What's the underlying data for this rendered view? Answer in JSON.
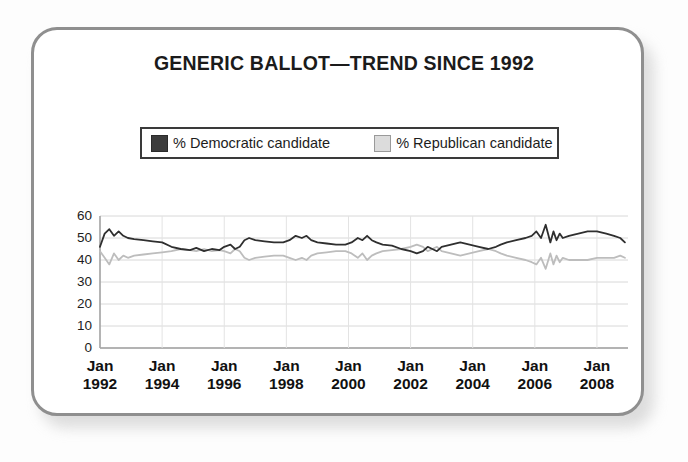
{
  "frame": {
    "border_color": "#8f8f8f",
    "background": "#ffffff"
  },
  "chart_data": {
    "type": "line",
    "title": "GENERIC BALLOT—TREND SINCE 1992",
    "xlabel": "",
    "ylabel": "",
    "ylim": [
      0,
      60
    ],
    "yticks": [
      60,
      50,
      40,
      30,
      20,
      10,
      0
    ],
    "grid": true,
    "legend_position": "top",
    "xticklabels": [
      {
        "month": "Jan",
        "year": "1992"
      },
      {
        "month": "Jan",
        "year": "1994"
      },
      {
        "month": "Jan",
        "year": "1996"
      },
      {
        "month": "Jan",
        "year": "1998"
      },
      {
        "month": "Jan",
        "year": "2000"
      },
      {
        "month": "Jan",
        "year": "2002"
      },
      {
        "month": "Jan",
        "year": "2004"
      },
      {
        "month": "Jan",
        "year": "2006"
      },
      {
        "month": "Jan",
        "year": "2008"
      }
    ],
    "xlim": [
      1992.0,
      2009.0
    ],
    "series": [
      {
        "name": "% Democratic candidate",
        "color": "#2f2f2f",
        "x": [
          1992.0,
          1992.15,
          1992.3,
          1992.45,
          1992.6,
          1992.75,
          1992.9,
          1993.1,
          1993.4,
          1993.7,
          1994.0,
          1994.3,
          1994.6,
          1994.9,
          1995.1,
          1995.35,
          1995.6,
          1995.85,
          1996.0,
          1996.2,
          1996.35,
          1996.5,
          1996.65,
          1996.8,
          1997.0,
          1997.3,
          1997.6,
          1997.9,
          1998.1,
          1998.3,
          1998.5,
          1998.65,
          1998.8,
          1999.0,
          1999.3,
          1999.6,
          1999.9,
          2000.1,
          2000.3,
          2000.45,
          2000.6,
          2000.75,
          2000.9,
          2001.1,
          2001.4,
          2001.7,
          2002.0,
          2002.2,
          2002.4,
          2002.55,
          2002.7,
          2002.85,
          2003.0,
          2003.3,
          2003.6,
          2003.9,
          2004.2,
          2004.5,
          2004.75,
          2004.9,
          2005.1,
          2005.4,
          2005.7,
          2005.9,
          2006.05,
          2006.2,
          2006.35,
          2006.5,
          2006.6,
          2006.7,
          2006.8,
          2006.9,
          2007.1,
          2007.4,
          2007.7,
          2008.0,
          2008.3,
          2008.55,
          2008.75,
          2008.9
        ],
        "y": [
          46,
          52,
          54,
          51,
          53,
          51,
          50,
          49.5,
          49,
          48.5,
          48,
          46,
          45,
          44.5,
          45.5,
          44,
          45,
          44.5,
          46,
          47,
          45,
          46,
          49,
          50,
          49,
          48.5,
          48,
          48,
          49,
          51,
          50,
          51,
          49,
          48,
          47.5,
          47,
          47,
          48,
          50,
          49,
          51,
          49,
          48,
          47,
          46.5,
          45,
          44,
          43,
          44,
          46,
          45,
          44,
          46,
          47,
          48,
          47,
          46,
          45,
          46,
          47,
          48,
          49,
          50,
          51,
          53,
          50,
          56,
          48,
          53,
          49,
          52,
          50,
          51,
          52,
          53,
          53,
          52,
          51,
          50,
          48
        ],
        "note": "Dark line, hovers 44–54, rises after 2005"
      },
      {
        "name": "% Republican candidate",
        "color": "#bdbdbd",
        "x": [
          1992.0,
          1992.15,
          1992.3,
          1992.45,
          1992.6,
          1992.75,
          1992.9,
          1993.1,
          1993.4,
          1993.7,
          1994.0,
          1994.3,
          1994.6,
          1994.9,
          1995.1,
          1995.35,
          1995.6,
          1995.85,
          1996.0,
          1996.2,
          1996.35,
          1996.5,
          1996.65,
          1996.8,
          1997.0,
          1997.3,
          1997.6,
          1997.9,
          1998.1,
          1998.3,
          1998.5,
          1998.65,
          1998.8,
          1999.0,
          1999.3,
          1999.6,
          1999.9,
          2000.1,
          2000.3,
          2000.45,
          2000.6,
          2000.75,
          2000.9,
          2001.1,
          2001.4,
          2001.7,
          2002.0,
          2002.2,
          2002.4,
          2002.55,
          2002.7,
          2002.85,
          2003.0,
          2003.3,
          2003.6,
          2003.9,
          2004.2,
          2004.5,
          2004.75,
          2004.9,
          2005.1,
          2005.4,
          2005.7,
          2005.9,
          2006.05,
          2006.2,
          2006.35,
          2006.5,
          2006.6,
          2006.7,
          2006.8,
          2006.9,
          2007.1,
          2007.4,
          2007.7,
          2008.0,
          2008.3,
          2008.55,
          2008.75,
          2008.9
        ],
        "y": [
          44,
          41,
          38,
          43,
          40,
          42,
          41,
          42,
          42.5,
          43,
          43.5,
          44,
          45,
          44.5,
          44,
          45,
          44,
          44.5,
          44,
          43,
          45,
          44,
          41,
          40,
          41,
          41.5,
          42,
          42,
          41,
          40,
          41,
          40,
          42,
          43,
          43.5,
          44,
          44,
          43,
          41,
          43,
          40,
          42,
          43,
          44,
          44.5,
          45,
          46,
          47,
          46,
          44,
          45,
          46,
          44,
          43,
          42,
          43,
          44,
          45,
          44,
          43,
          42,
          41,
          40,
          39,
          38,
          41,
          36,
          43,
          38,
          42,
          39,
          41,
          40,
          40,
          40,
          41,
          41,
          41,
          42,
          41
        ],
        "note": "Light gray line, hovers 36–47, declines after 2005"
      }
    ]
  }
}
